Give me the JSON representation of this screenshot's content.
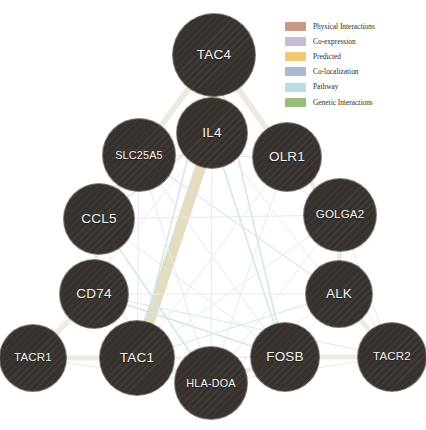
{
  "diagram": {
    "type": "gene-interaction-network",
    "background_color": "#ffffff",
    "node_fill_color": "#37322e",
    "node_text_color": "#f4f2ef"
  },
  "legend": {
    "items": [
      {
        "label": "Physical Interactions",
        "color": "#c79a88",
        "swatch_name": "physical-interactions-swatch"
      },
      {
        "label": "Co-expression",
        "color": "#c6bcda",
        "swatch_name": "co-expression-swatch"
      },
      {
        "label": "Predicted",
        "color": "#f2c877",
        "swatch_name": "predicted-swatch"
      },
      {
        "label": "Co-localization",
        "color": "#aab9d6",
        "swatch_name": "co-localization-swatch"
      },
      {
        "label": "Pathway",
        "color": "#bbdde2",
        "swatch_name": "pathway-swatch"
      },
      {
        "label": "Genetic Interactions",
        "color": "#9abd7e",
        "swatch_name": "genetic-interactions-swatch"
      }
    ]
  },
  "nodes": [
    {
      "id": "TAC4",
      "label": "TAC4",
      "cx": 214,
      "cy": 55,
      "r": 41
    },
    {
      "id": "IL4",
      "label": "IL4",
      "cx": 212,
      "cy": 133,
      "r": 35
    },
    {
      "id": "SLC25A5",
      "label": "SLC25A5",
      "cx": 139,
      "cy": 155,
      "r": 36
    },
    {
      "id": "OLR1",
      "label": "OLR1",
      "cx": 287,
      "cy": 157,
      "r": 34
    },
    {
      "id": "CCL5",
      "label": "CCL5",
      "cx": 99,
      "cy": 219,
      "r": 35
    },
    {
      "id": "GOLGA2",
      "label": "GOLGA2",
      "cx": 340,
      "cy": 215,
      "r": 36
    },
    {
      "id": "CD74",
      "label": "CD74",
      "cx": 94,
      "cy": 294,
      "r": 34
    },
    {
      "id": "ALK",
      "label": "ALK",
      "cx": 339,
      "cy": 294,
      "r": 33
    },
    {
      "id": "TACR1",
      "label": "TACR1",
      "cx": 33,
      "cy": 358,
      "r": 33
    },
    {
      "id": "TAC1",
      "label": "TAC1",
      "cx": 137,
      "cy": 358,
      "r": 37
    },
    {
      "id": "HLA-DOA",
      "label": "HLA-DOA",
      "cx": 211,
      "cy": 383,
      "r": 36
    },
    {
      "id": "FOSB",
      "label": "FOSB",
      "cx": 285,
      "cy": 357,
      "r": 34
    },
    {
      "id": "TACR2",
      "label": "TACR2",
      "cx": 392,
      "cy": 357,
      "r": 34
    }
  ],
  "edges": [
    {
      "source": "TAC4",
      "target": "IL4",
      "type": "Co-expression",
      "color": "#e4dcc0",
      "width": 9.5
    },
    {
      "source": "IL4",
      "target": "TAC1",
      "type": "Co-expression",
      "color": "#e4dcc0",
      "width": 11
    },
    {
      "source": "TAC4",
      "target": "SLC25A5",
      "type": "Co-expression",
      "color": "#efeade",
      "width": 6
    },
    {
      "source": "TAC4",
      "target": "OLR1",
      "type": "Co-expression",
      "color": "#efeade",
      "width": 6
    },
    {
      "source": "SLC25A5",
      "target": "CCL5",
      "type": "Co-expression",
      "color": "#f0ebe0",
      "width": 5
    },
    {
      "source": "CCL5",
      "target": "CD74",
      "type": "Co-expression",
      "color": "#f0ebe0",
      "width": 5
    },
    {
      "source": "CD74",
      "target": "TACR1",
      "type": "Co-expression",
      "color": "#f0ebe0",
      "width": 5
    },
    {
      "source": "TACR1",
      "target": "TAC1",
      "type": "Co-expression",
      "color": "#f0ebe0",
      "width": 5
    },
    {
      "source": "TAC1",
      "target": "HLA-DOA",
      "type": "Co-expression",
      "color": "#f0ebe0",
      "width": 5
    },
    {
      "source": "HLA-DOA",
      "target": "FOSB",
      "type": "Co-expression",
      "color": "#f0ebe0",
      "width": 5
    },
    {
      "source": "FOSB",
      "target": "TACR2",
      "type": "Co-expression",
      "color": "#f0ebe0",
      "width": 5
    },
    {
      "source": "TACR2",
      "target": "ALK",
      "type": "Co-expression",
      "color": "#f0ebe0",
      "width": 5
    },
    {
      "source": "ALK",
      "target": "GOLGA2",
      "type": "Co-expression",
      "color": "#f0ebe0",
      "width": 5
    },
    {
      "source": "GOLGA2",
      "target": "OLR1",
      "type": "Co-expression",
      "color": "#f0ebe0",
      "width": 5
    },
    {
      "source": "TAC4",
      "target": "TAC1",
      "type": "Pathway",
      "color": "#cfe6e8",
      "width": 1.4
    },
    {
      "source": "TAC4",
      "target": "FOSB",
      "type": "Pathway",
      "color": "#cfe6e8",
      "width": 1.4
    },
    {
      "source": "IL4",
      "target": "CCL5",
      "type": "Pathway",
      "color": "#cfe6e8",
      "width": 1.4
    },
    {
      "source": "IL4",
      "target": "FOSB",
      "type": "Pathway",
      "color": "#cfe6e8",
      "width": 1.4
    },
    {
      "source": "CD74",
      "target": "FOSB",
      "type": "Pathway",
      "color": "#cfe6e8",
      "width": 1.4
    },
    {
      "source": "CCL5",
      "target": "HLA-DOA",
      "type": "Pathway",
      "color": "#cfe6e8",
      "width": 1.4
    },
    {
      "source": "CD74",
      "target": "TACR2",
      "type": "Pathway",
      "color": "#d5e8ea",
      "width": 1.2
    },
    {
      "source": "TAC1",
      "target": "ALK",
      "type": "Pathway",
      "color": "#d5e8ea",
      "width": 1.2
    },
    {
      "source": "SLC25A5",
      "target": "OLR1",
      "type": "Co-localization",
      "color": "#dfe3ee",
      "width": 1.1
    },
    {
      "source": "SLC25A5",
      "target": "ALK",
      "type": "Co-localization",
      "color": "#dfe3ee",
      "width": 1.1
    },
    {
      "source": "SLC25A5",
      "target": "FOSB",
      "type": "Co-localization",
      "color": "#e4e7f0",
      "width": 1
    },
    {
      "source": "CCL5",
      "target": "GOLGA2",
      "type": "Co-localization",
      "color": "#e4e7f0",
      "width": 1
    },
    {
      "source": "CCL5",
      "target": "FOSB",
      "type": "Co-localization",
      "color": "#e4e7f0",
      "width": 1
    },
    {
      "source": "CCL5",
      "target": "TAC1",
      "type": "Co-localization",
      "color": "#e4e7f0",
      "width": 1
    },
    {
      "source": "CD74",
      "target": "HLA-DOA",
      "type": "Co-localization",
      "color": "#e4e7f0",
      "width": 1
    },
    {
      "source": "CD74",
      "target": "ALK",
      "type": "Co-localization",
      "color": "#e8eaf2",
      "width": 1
    },
    {
      "source": "OLR1",
      "target": "TACR2",
      "type": "Co-localization",
      "color": "#e8eaf2",
      "width": 1
    },
    {
      "source": "OLR1",
      "target": "HLA-DOA",
      "type": "Co-localization",
      "color": "#e8eaf2",
      "width": 1
    },
    {
      "source": "OLR1",
      "target": "TAC1",
      "type": "Co-localization",
      "color": "#e8eaf2",
      "width": 1
    },
    {
      "source": "GOLGA2",
      "target": "TACR2",
      "type": "Co-localization",
      "color": "#e8eaf2",
      "width": 1
    },
    {
      "source": "GOLGA2",
      "target": "HLA-DOA",
      "type": "Co-localization",
      "color": "#e8eaf2",
      "width": 1
    },
    {
      "source": "GOLGA2",
      "target": "TAC1",
      "type": "Co-localization",
      "color": "#e8eaf2",
      "width": 1
    },
    {
      "source": "ALK",
      "target": "HLA-DOA",
      "type": "Co-localization",
      "color": "#e8eaf2",
      "width": 1
    },
    {
      "source": "ALK",
      "target": "FOSB",
      "type": "Co-localization",
      "color": "#e8eaf2",
      "width": 1
    },
    {
      "source": "TACR1",
      "target": "HLA-DOA",
      "type": "Co-localization",
      "color": "#e8eaf2",
      "width": 1
    },
    {
      "source": "TACR1",
      "target": "FOSB",
      "type": "Co-localization",
      "color": "#e8eaf2",
      "width": 1
    },
    {
      "source": "TACR1",
      "target": "TACR2",
      "type": "Co-localization",
      "color": "#e8eaf2",
      "width": 1
    },
    {
      "source": "TAC1",
      "target": "FOSB",
      "type": "Co-localization",
      "color": "#e8eaf2",
      "width": 1
    },
    {
      "source": "TAC1",
      "target": "TACR2",
      "type": "Co-localization",
      "color": "#e8eaf2",
      "width": 1
    },
    {
      "source": "HLA-DOA",
      "target": "TACR2",
      "type": "Co-localization",
      "color": "#e8eaf2",
      "width": 1
    },
    {
      "source": "IL4",
      "target": "ALK",
      "type": "Co-localization",
      "color": "#e8eaf2",
      "width": 1
    },
    {
      "source": "IL4",
      "target": "GOLGA2",
      "type": "Co-localization",
      "color": "#e8eaf2",
      "width": 1
    },
    {
      "source": "IL4",
      "target": "TACR1",
      "type": "Co-localization",
      "color": "#e8eaf2",
      "width": 1
    },
    {
      "source": "IL4",
      "target": "HLA-DOA",
      "type": "Co-localization",
      "color": "#e8eaf2",
      "width": 1
    },
    {
      "source": "SLC25A5",
      "target": "HLA-DOA",
      "type": "Co-localization",
      "color": "#e8eaf2",
      "width": 1
    },
    {
      "source": "SLC25A5",
      "target": "TAC1",
      "type": "Co-localization",
      "color": "#e8eaf2",
      "width": 1
    },
    {
      "source": "CD74",
      "target": "TAC1",
      "type": "Co-localization",
      "color": "#e8eaf2",
      "width": 1
    }
  ]
}
